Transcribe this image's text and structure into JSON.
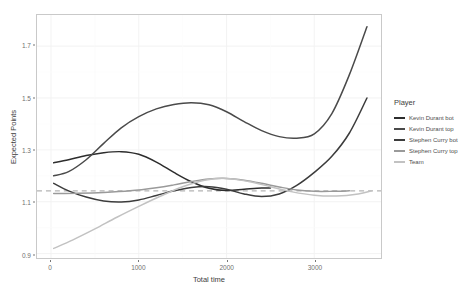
{
  "chart_data": {
    "type": "line",
    "title": "",
    "xlabel": "Total time",
    "ylabel": "Expected Points",
    "xlim": [
      -160,
      3760
    ],
    "ylim": [
      0.883,
      1.82
    ],
    "xticks": [
      0,
      1000,
      2000,
      3000
    ],
    "xticklabels": [
      "0",
      "1000",
      "2000",
      "3000"
    ],
    "yticks": [
      0.9,
      1.1,
      1.3,
      1.5,
      1.7
    ],
    "yticklabels": [
      "0.9",
      "1.1",
      "1.3",
      "1.5",
      "1.7"
    ],
    "grid": true,
    "legend_position": "right",
    "reference_line": {
      "name": "overall-average",
      "value": 1.142,
      "style": "dashed",
      "color": "#b4b4b4"
    },
    "series": [
      {
        "name": "Kevin Durant bot",
        "color": "#2d2d2d",
        "x": [
          30,
          200,
          400,
          600,
          800,
          1000,
          1200,
          1400,
          1600,
          1800,
          2000,
          2200,
          2400,
          2500
        ],
        "y": [
          1.25,
          1.262,
          1.278,
          1.289,
          1.293,
          1.283,
          1.253,
          1.213,
          1.177,
          1.152,
          1.143,
          1.148,
          1.153,
          1.153
        ]
      },
      {
        "name": "Kevin Durant top",
        "color": "#4a4a4a",
        "x": [
          30,
          200,
          400,
          600,
          800,
          1000,
          1200,
          1400,
          1600,
          1800,
          2000,
          2200,
          2400,
          2600,
          2800,
          3000,
          3200,
          3400,
          3600
        ],
        "y": [
          1.2,
          1.216,
          1.262,
          1.325,
          1.385,
          1.428,
          1.458,
          1.475,
          1.482,
          1.474,
          1.447,
          1.409,
          1.374,
          1.351,
          1.345,
          1.362,
          1.44,
          1.59,
          1.775
        ]
      },
      {
        "name": "Stephen Curry bot",
        "color": "#3c3c3c",
        "x": [
          30,
          200,
          400,
          600,
          800,
          1000,
          1200,
          1400,
          1600,
          1800,
          2000,
          2200,
          2400,
          2600,
          2800,
          3000,
          3200,
          3400,
          3600
        ],
        "y": [
          1.171,
          1.142,
          1.118,
          1.103,
          1.099,
          1.107,
          1.124,
          1.142,
          1.155,
          1.158,
          1.148,
          1.13,
          1.12,
          1.13,
          1.163,
          1.213,
          1.275,
          1.365,
          1.5
        ]
      },
      {
        "name": "Stephen Curry top",
        "color": "#9a9a9a",
        "x": [
          30,
          300,
          600,
          900,
          1200,
          1400,
          1600,
          1800,
          2000,
          2200,
          2400,
          2600,
          2800,
          3000,
          3200,
          3400
        ],
        "y": [
          1.132,
          1.133,
          1.136,
          1.142,
          1.154,
          1.165,
          1.178,
          1.188,
          1.19,
          1.183,
          1.171,
          1.157,
          1.145,
          1.14,
          1.14,
          1.142
        ]
      },
      {
        "name": "Team",
        "color": "#c2c2c2",
        "x": [
          30,
          250,
          500,
          750,
          1000,
          1250,
          1500,
          1750,
          2000,
          2250,
          2500,
          2750,
          3000,
          3250,
          3500,
          3650
        ],
        "y": [
          0.92,
          0.953,
          0.995,
          1.04,
          1.082,
          1.122,
          1.158,
          1.183,
          1.19,
          1.178,
          1.158,
          1.138,
          1.125,
          1.122,
          1.13,
          1.142
        ]
      }
    ]
  },
  "legend": {
    "title": "Player",
    "items": [
      {
        "label": "Kevin Durant bot",
        "color": "#2d2d2d"
      },
      {
        "label": "Kevin Durant top",
        "color": "#4a4a4a"
      },
      {
        "label": "Stephen Curry bot",
        "color": "#3c3c3c"
      },
      {
        "label": "Stephen Curry top",
        "color": "#9a9a9a"
      },
      {
        "label": "Team",
        "color": "#c2c2c2"
      }
    ]
  }
}
